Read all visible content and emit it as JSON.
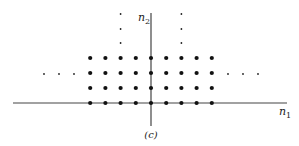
{
  "figure": {
    "caption": "(c)",
    "axes": {
      "x_label": "n",
      "x_sub": "1",
      "y_label": "n",
      "y_sub": "2"
    },
    "filled_points": {
      "n1_range": [
        -4,
        4
      ],
      "n2_range": [
        0,
        3
      ]
    },
    "continuation_dots": {
      "left_row_n2": 2,
      "right_row_n2": 2,
      "up_columns_n1": [
        -2,
        2
      ]
    },
    "colors": {
      "ink": "#222222",
      "background": "#ffffff"
    }
  }
}
